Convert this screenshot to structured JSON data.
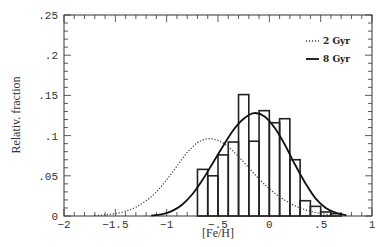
{
  "chart_data": {
    "type": "bar",
    "title": "",
    "xlabel": "[Fe/H]",
    "ylabel": "Relativ. fraction",
    "xlim": [
      -2,
      1
    ],
    "ylim": [
      0,
      0.25
    ],
    "grid": false,
    "legend_position": "upper right",
    "x_ticks": [
      "-2",
      "-1.5",
      "-1",
      "-.5",
      "0",
      ".5",
      "1"
    ],
    "x_tick_values": [
      -2,
      -1.5,
      -1,
      -0.5,
      0,
      0.5,
      1
    ],
    "y_ticks": [
      "0",
      ".05",
      ".1",
      ".15",
      ".2",
      ".25"
    ],
    "y_tick_values": [
      0,
      0.05,
      0.1,
      0.15,
      0.2,
      0.25
    ],
    "histogram": {
      "bin_width": 0.1,
      "bin_left_edges": [
        -0.7,
        -0.6,
        -0.5,
        -0.4,
        -0.3,
        -0.2,
        -0.1,
        0.0,
        0.1,
        0.2,
        0.3,
        0.4,
        0.5,
        0.6
      ],
      "values": [
        0.058,
        0.05,
        0.076,
        0.092,
        0.151,
        0.093,
        0.131,
        0.116,
        0.121,
        0.07,
        0.019,
        0.012,
        0.005,
        0.003
      ]
    },
    "series": [
      {
        "name": "2 Gyr",
        "style": "dotted",
        "type": "line",
        "x": [
          -1.7,
          -1.6,
          -1.5,
          -1.4,
          -1.3,
          -1.2,
          -1.1,
          -1.0,
          -0.9,
          -0.8,
          -0.7,
          -0.6,
          -0.5,
          -0.4,
          -0.3,
          -0.2,
          -0.1,
          0.0,
          0.1,
          0.2,
          0.3,
          0.4,
          0.5,
          0.6,
          0.7
        ],
        "values": [
          0.0005,
          0.0015,
          0.003,
          0.006,
          0.011,
          0.019,
          0.03,
          0.045,
          0.062,
          0.079,
          0.091,
          0.096,
          0.094,
          0.086,
          0.074,
          0.06,
          0.046,
          0.034,
          0.024,
          0.016,
          0.01,
          0.006,
          0.003,
          0.0015,
          0.0005
        ]
      },
      {
        "name": "8 Gyr",
        "style": "solid",
        "type": "line",
        "x": [
          -1.15,
          -1.05,
          -0.95,
          -0.85,
          -0.75,
          -0.65,
          -0.55,
          -0.45,
          -0.35,
          -0.25,
          -0.15,
          -0.05,
          0.05,
          0.15,
          0.25,
          0.35,
          0.45,
          0.55,
          0.65,
          0.75
        ],
        "values": [
          0.0005,
          0.002,
          0.006,
          0.014,
          0.027,
          0.045,
          0.066,
          0.087,
          0.107,
          0.121,
          0.128,
          0.124,
          0.11,
          0.089,
          0.064,
          0.041,
          0.022,
          0.01,
          0.004,
          0.001
        ]
      }
    ]
  },
  "legend": [
    {
      "label": "2 Gyr",
      "style": "dotted"
    },
    {
      "label": "8 Gyr",
      "style": "solid"
    }
  ],
  "colors": {
    "axis": "#333333",
    "bars": "#222222",
    "curve_2gyr": "#444444",
    "curve_8gyr": "#111111"
  }
}
